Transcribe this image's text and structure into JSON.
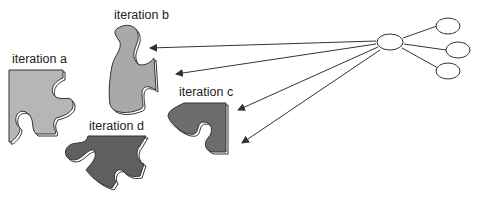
{
  "diagram": {
    "labels": {
      "a": "iteration a",
      "b": "iteration b",
      "c": "iteration c",
      "d": "iteration d"
    },
    "colors": {
      "piece_light": "#b4b4b4",
      "piece_mid": "#a8a8a8",
      "piece_dark": "#6a6a6a",
      "outline": "#333333",
      "line": "#333333"
    },
    "nodes": {
      "hub": "central node",
      "children": [
        "child node 1",
        "child node 2",
        "child node 3"
      ]
    }
  }
}
